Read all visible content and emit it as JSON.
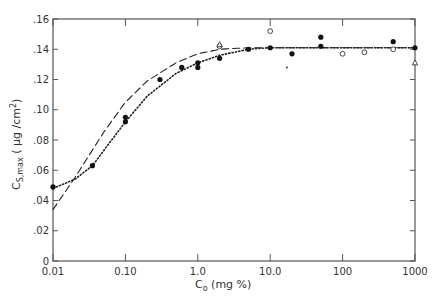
{
  "chart_data": {
    "type": "scatter",
    "title": "",
    "xlabel": "C_o (mg %)",
    "ylabel": "C_S,max (μg/cm²)",
    "xscale": "log",
    "xlim": [
      0.01,
      1000
    ],
    "ylim": [
      0,
      0.16
    ],
    "x_ticks": [
      "0.01",
      "0.10",
      "1.0",
      "10.0",
      "100",
      "1000"
    ],
    "x_tick_values": [
      0.01,
      0.1,
      1,
      10,
      100,
      1000
    ],
    "y_ticks": [
      "0",
      ".02",
      ".04",
      ".06",
      ".08",
      ".10",
      ".12",
      ".14",
      ".16"
    ],
    "y_tick_values": [
      0,
      0.02,
      0.04,
      0.06,
      0.08,
      0.1,
      0.12,
      0.14,
      0.16
    ],
    "grid": false,
    "legend": null,
    "series": [
      {
        "name": "filled circles",
        "marker": "filled-circle",
        "points": [
          [
            0.01,
            0.049
          ],
          [
            0.035,
            0.063
          ],
          [
            0.1,
            0.092
          ],
          [
            0.1,
            0.095
          ],
          [
            0.3,
            0.12
          ],
          [
            0.6,
            0.128
          ],
          [
            1.0,
            0.128
          ],
          [
            1.0,
            0.131
          ],
          [
            2.0,
            0.134
          ],
          [
            5.0,
            0.14
          ],
          [
            10.0,
            0.141
          ],
          [
            20.0,
            0.137
          ],
          [
            50.0,
            0.148
          ],
          [
            50.0,
            0.142
          ],
          [
            500.0,
            0.145
          ],
          [
            1000.0,
            0.141
          ]
        ]
      },
      {
        "name": "open circles",
        "marker": "open-circle",
        "points": [
          [
            2.0,
            0.142
          ],
          [
            10.0,
            0.152
          ],
          [
            100.0,
            0.137
          ],
          [
            200.0,
            0.138
          ],
          [
            500.0,
            0.14
          ]
        ]
      },
      {
        "name": "open triangles",
        "marker": "open-triangle",
        "points": [
          [
            2.0,
            0.143
          ],
          [
            1000.0,
            0.131
          ]
        ]
      },
      {
        "name": "small dot",
        "marker": "dot",
        "points": [
          [
            17.0,
            0.128
          ]
        ]
      }
    ],
    "curves": [
      {
        "name": "dashed fit",
        "style": "dashed",
        "points": [
          [
            0.01,
            0.034
          ],
          [
            0.02,
            0.055
          ],
          [
            0.05,
            0.085
          ],
          [
            0.1,
            0.105
          ],
          [
            0.2,
            0.119
          ],
          [
            0.5,
            0.131
          ],
          [
            1.0,
            0.137
          ],
          [
            2.0,
            0.14
          ],
          [
            5.0,
            0.141
          ],
          [
            10.0,
            0.141
          ],
          [
            100.0,
            0.141
          ],
          [
            1000.0,
            0.141
          ]
        ]
      },
      {
        "name": "dotted fit",
        "style": "dotted",
        "points": [
          [
            0.01,
            0.048
          ],
          [
            0.02,
            0.054
          ],
          [
            0.035,
            0.063
          ],
          [
            0.06,
            0.078
          ],
          [
            0.1,
            0.092
          ],
          [
            0.2,
            0.109
          ],
          [
            0.5,
            0.124
          ],
          [
            1.0,
            0.131
          ],
          [
            2.0,
            0.136
          ],
          [
            5.0,
            0.14
          ],
          [
            10.0,
            0.141
          ],
          [
            100.0,
            0.141
          ],
          [
            1000.0,
            0.141
          ]
        ]
      }
    ]
  },
  "axes": {
    "x_label_main": "C",
    "x_label_sub": "o",
    "x_label_rest": " (mg %)",
    "y_label_main": "C",
    "y_label_sub": "S,max",
    "y_label_rest": " ( μg /cm",
    "y_label_sup": "2",
    "y_label_close": ")"
  }
}
